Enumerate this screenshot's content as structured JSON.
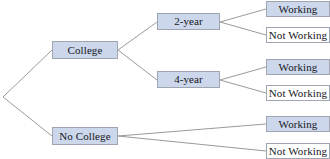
{
  "diagram": {
    "type": "tree",
    "colors": {
      "node_fill_highlight": "#ccd7ec",
      "node_fill_plain": "#ffffff",
      "node_border": "#9fa6b2",
      "edge_stroke": "#9a9a9a",
      "text": "#15161a",
      "background": "#ffffff"
    },
    "root": {
      "x": 3,
      "y": 97
    },
    "nodes": [
      {
        "id": "college",
        "label": "College",
        "x": 52,
        "y": 41,
        "w": 66,
        "h": 18,
        "fill": "highlight"
      },
      {
        "id": "no-college",
        "label": "No College",
        "x": 52,
        "y": 127,
        "w": 66,
        "h": 18,
        "fill": "highlight"
      },
      {
        "id": "two-year",
        "label": "2-year",
        "x": 157,
        "y": 13,
        "w": 63,
        "h": 17,
        "fill": "highlight"
      },
      {
        "id": "four-year",
        "label": "4-year",
        "x": 157,
        "y": 71,
        "w": 63,
        "h": 17,
        "fill": "highlight"
      },
      {
        "id": "two-working",
        "label": "Working",
        "x": 266,
        "y": 1,
        "w": 64,
        "h": 16,
        "fill": "highlight"
      },
      {
        "id": "two-not-working",
        "label": "Not Working",
        "x": 266,
        "y": 27,
        "w": 64,
        "h": 16,
        "fill": "plain"
      },
      {
        "id": "four-working",
        "label": "Working",
        "x": 266,
        "y": 59,
        "w": 64,
        "h": 16,
        "fill": "highlight"
      },
      {
        "id": "four-not-working",
        "label": "Not Working",
        "x": 266,
        "y": 85,
        "w": 64,
        "h": 16,
        "fill": "plain"
      },
      {
        "id": "nc-working",
        "label": "Working",
        "x": 266,
        "y": 116,
        "w": 64,
        "h": 16,
        "fill": "highlight"
      },
      {
        "id": "nc-not-working",
        "label": "Not Working",
        "x": 266,
        "y": 143,
        "w": 64,
        "h": 16,
        "fill": "plain"
      }
    ],
    "edges": [
      {
        "id": "root-college",
        "from": "root",
        "to": "college",
        "x1": 3,
        "y1": 97,
        "x2": 52,
        "y2": 50
      },
      {
        "id": "root-no-college",
        "from": "root",
        "to": "no-college",
        "x1": 3,
        "y1": 97,
        "x2": 52,
        "y2": 136
      },
      {
        "id": "college-two-year",
        "from": "college",
        "to": "two-year",
        "x1": 118,
        "y1": 50,
        "x2": 157,
        "y2": 22
      },
      {
        "id": "college-four-year",
        "from": "college",
        "to": "four-year",
        "x1": 118,
        "y1": 50,
        "x2": 157,
        "y2": 80
      },
      {
        "id": "two-year-working",
        "from": "two-year",
        "to": "two-working",
        "x1": 220,
        "y1": 22,
        "x2": 266,
        "y2": 9
      },
      {
        "id": "two-year-not-working",
        "from": "two-year",
        "to": "two-not-working",
        "x1": 220,
        "y1": 22,
        "x2": 266,
        "y2": 35
      },
      {
        "id": "four-year-working",
        "from": "four-year",
        "to": "four-working",
        "x1": 220,
        "y1": 80,
        "x2": 266,
        "y2": 67
      },
      {
        "id": "four-year-not-working",
        "from": "four-year",
        "to": "four-not-working",
        "x1": 220,
        "y1": 80,
        "x2": 266,
        "y2": 93
      },
      {
        "id": "no-college-working",
        "from": "no-college",
        "to": "nc-working",
        "x1": 118,
        "y1": 136,
        "x2": 266,
        "y2": 124
      },
      {
        "id": "no-college-not-working",
        "from": "no-college",
        "to": "nc-not-working",
        "x1": 118,
        "y1": 136,
        "x2": 266,
        "y2": 151
      }
    ]
  }
}
